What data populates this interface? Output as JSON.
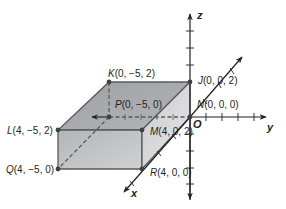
{
  "figure": {
    "type": "3d-coordinate-box",
    "colors": {
      "top_face": "#a7a9ac",
      "front_face": "#c4c5c7",
      "side_face": "#d5d6d8",
      "edge": "#58595b",
      "axis": "#231f20",
      "hidden_edge": "#58595b",
      "vertex": "#414042"
    },
    "axes": {
      "x": "x",
      "y": "y",
      "z": "z",
      "origin": "O"
    },
    "vertices": {
      "K": {
        "name": "K",
        "coords": "(0, −5, 2)",
        "label": "K(0, −5, 2)"
      },
      "P": {
        "name": "P",
        "coords": "(0, −5, 0)",
        "label": "P(0, −5, 0)"
      },
      "J": {
        "name": "J",
        "coords": "(0, 0, 2)",
        "label": "J(0, 0, 2)"
      },
      "N": {
        "name": "N",
        "coords": "(0, 0, 0)",
        "label": "N(0, 0, 0)"
      },
      "L": {
        "name": "L",
        "coords": "(4, −5, 2)",
        "label": "L(4, −5, 2)"
      },
      "M": {
        "name": "M",
        "coords": "(4, 0, 2)",
        "label": "M(4, 0, 2)"
      },
      "Q": {
        "name": "Q",
        "coords": "(4, −5, 0)",
        "label": "Q(4, −5, 0)"
      },
      "R": {
        "name": "R",
        "coords": "(4, 0, 0)",
        "label": "R(4, 0, 0)"
      }
    },
    "label_parts": {
      "K": {
        "letter": "K",
        "rest": "(0, −5, 2)"
      },
      "P": {
        "letter": "P",
        "rest": "(0, −5, 0)"
      },
      "J": {
        "letter": "J",
        "rest": "(0, 0, 2)"
      },
      "N": {
        "letter": "N",
        "rest": "(0, 0, 0)"
      },
      "L": {
        "letter": "L",
        "rest": "(4, −5, 2)"
      },
      "M": {
        "letter": "M",
        "rest": "(4, 0, 2)"
      },
      "Q": {
        "letter": "Q",
        "rest": "(4, −5, 0)"
      },
      "R": {
        "letter": "R",
        "rest": "(4, 0, 0)"
      }
    }
  }
}
